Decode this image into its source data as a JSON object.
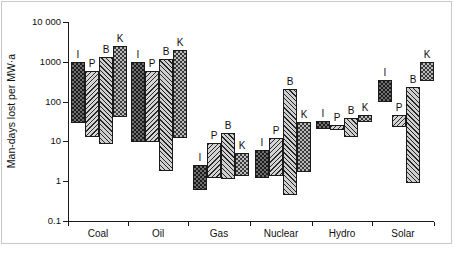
{
  "figure": {
    "background": "#ffffff",
    "frame_color": "#c9c9c9"
  },
  "axes": {
    "y_title": "Man-days lost per MW·a",
    "y_ticks": [
      "10 000",
      "1000",
      "100",
      "10",
      "1",
      "0.1"
    ],
    "y_tick_values": [
      10000,
      1000,
      100,
      10,
      1,
      0.1
    ],
    "y_scale": "log",
    "x_title": "",
    "x_categories": [
      "Coal",
      "Oil",
      "Gas",
      "Nuclear",
      "Hydro",
      "Solar"
    ],
    "grid": "none",
    "legend": "none"
  },
  "series_labels": {
    "I": "I",
    "P": "P",
    "B": "B",
    "K": "K"
  },
  "colors": {
    "axis": "#1a1a1a",
    "bar_outline": "#1b1b1b",
    "pat_I": "#6e6e6e",
    "pat_P": "#d4d4d4",
    "pat_B": "#cfcfcf",
    "pat_K": "#b9b9b9"
  },
  "chart_data": {
    "type": "bar",
    "subtype": "floating-range-bar",
    "title": "",
    "xlabel": "",
    "ylabel": "Man-days lost per MW·a",
    "yscale": "log",
    "ylim": [
      0.1,
      10000
    ],
    "yticks": [
      0.1,
      1,
      10,
      100,
      1000,
      10000
    ],
    "ytick_labels": [
      "0.1",
      "1",
      "10",
      "100",
      "1000",
      "10 000"
    ],
    "categories": [
      "Coal",
      "Oil",
      "Gas",
      "Nuclear",
      "Hydro",
      "Solar"
    ],
    "series_names": [
      "I",
      "P",
      "B",
      "K"
    ],
    "note": "Each bar spans a low-to-high estimate range; values read off the log axis.",
    "bars": [
      {
        "category": "Coal",
        "series": "I",
        "label": "I",
        "low": 30,
        "high": 1000
      },
      {
        "category": "Coal",
        "series": "P",
        "label": "P",
        "low": 13,
        "high": 600
      },
      {
        "category": "Coal",
        "series": "B",
        "label": "B",
        "low": 8.5,
        "high": 1300
      },
      {
        "category": "Coal",
        "series": "K",
        "label": "K",
        "low": 40,
        "high": 2500
      },
      {
        "category": "Oil",
        "series": "I",
        "label": "I",
        "low": 10,
        "high": 1000
      },
      {
        "category": "Oil",
        "series": "P",
        "label": "P",
        "low": 10,
        "high": 600
      },
      {
        "category": "Oil",
        "series": "B",
        "label": "B",
        "low": 1.8,
        "high": 1200
      },
      {
        "category": "Oil",
        "series": "K",
        "label": "K",
        "low": 12,
        "high": 2000
      },
      {
        "category": "Gas",
        "series": "I",
        "label": "I",
        "low": 0.6,
        "high": 2.6
      },
      {
        "category": "Gas",
        "series": "P",
        "label": "P",
        "low": 1.2,
        "high": 9
      },
      {
        "category": "Gas",
        "series": "B",
        "label": "B",
        "low": 1.1,
        "high": 16
      },
      {
        "category": "Gas",
        "series": "K",
        "label": "K",
        "low": 1.3,
        "high": 5
      },
      {
        "category": "Nuclear",
        "series": "I",
        "label": "I",
        "low": 1.2,
        "high": 6
      },
      {
        "category": "Nuclear",
        "series": "P",
        "label": "P",
        "low": 1.3,
        "high": 12
      },
      {
        "category": "Nuclear",
        "series": "B",
        "label": "B",
        "low": 0.45,
        "high": 210
      },
      {
        "category": "Nuclear",
        "series": "K",
        "label": "K",
        "low": 1.7,
        "high": 30
      },
      {
        "category": "Hydro",
        "series": "I",
        "label": "I",
        "low": 20,
        "high": 32
      },
      {
        "category": "Hydro",
        "series": "P",
        "label": "P",
        "low": 20,
        "high": 26
      },
      {
        "category": "Hydro",
        "series": "B",
        "label": "B",
        "low": 13,
        "high": 38
      },
      {
        "category": "Hydro",
        "series": "K",
        "label": "K",
        "low": 30,
        "high": 45
      },
      {
        "category": "Solar",
        "series": "I",
        "label": "I",
        "low": 95,
        "high": 340
      },
      {
        "category": "Solar",
        "series": "P",
        "label": "P",
        "low": 22,
        "high": 45
      },
      {
        "category": "Solar",
        "series": "B",
        "label": "B",
        "low": 0.9,
        "high": 230
      },
      {
        "category": "Solar",
        "series": "K",
        "label": "K",
        "low": 340,
        "high": 1000
      }
    ]
  },
  "geometry": {
    "plot_left": 68,
    "plot_top": 22,
    "plot_width": 366,
    "plot_height": 200,
    "bar_width": 14,
    "x_tick_px": [
      68,
      128,
      188,
      250,
      312,
      372,
      434
    ],
    "groups": [
      {
        "category": "Coal",
        "label_center": 98,
        "bar_lefts": [
          71,
          85,
          99,
          113
        ]
      },
      {
        "category": "Oil",
        "label_center": 158,
        "bar_lefts": [
          131,
          145,
          159,
          173
        ]
      },
      {
        "category": "Gas",
        "label_center": 219,
        "bar_lefts": [
          193,
          207,
          221,
          235
        ]
      },
      {
        "category": "Nuclear",
        "label_center": 281,
        "bar_lefts": [
          255,
          269,
          283,
          297
        ]
      },
      {
        "category": "Hydro",
        "label_center": 342,
        "bar_lefts": [
          316,
          330,
          344,
          358
        ]
      },
      {
        "category": "Solar",
        "label_center": 403,
        "bar_lefts": [
          378,
          392,
          406,
          420
        ]
      }
    ]
  }
}
